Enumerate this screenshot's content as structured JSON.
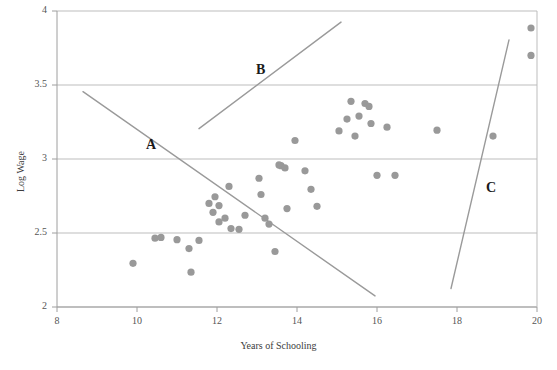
{
  "chart_data": {
    "type": "scatter",
    "title": "",
    "xlabel": "Years of Schooling",
    "ylabel": "Log Wage",
    "xlim": [
      8,
      20
    ],
    "ylim": [
      2,
      4
    ],
    "xticks": [
      8,
      10,
      12,
      14,
      16,
      18,
      20
    ],
    "yticks": [
      2,
      2.5,
      3,
      3.5,
      4
    ],
    "grid": "horizontal",
    "legend": "none",
    "marker_color": "#999999",
    "line_color": "#9a9a9a",
    "points": [
      {
        "x": 9.9,
        "y": 2.295
      },
      {
        "x": 10.45,
        "y": 2.465
      },
      {
        "x": 10.6,
        "y": 2.47
      },
      {
        "x": 11.0,
        "y": 2.455
      },
      {
        "x": 11.3,
        "y": 2.395
      },
      {
        "x": 11.35,
        "y": 2.235
      },
      {
        "x": 11.55,
        "y": 2.45
      },
      {
        "x": 11.8,
        "y": 2.7
      },
      {
        "x": 11.9,
        "y": 2.64
      },
      {
        "x": 11.95,
        "y": 2.745
      },
      {
        "x": 12.05,
        "y": 2.685
      },
      {
        "x": 12.05,
        "y": 2.575
      },
      {
        "x": 12.2,
        "y": 2.6
      },
      {
        "x": 12.3,
        "y": 2.815
      },
      {
        "x": 12.35,
        "y": 2.53
      },
      {
        "x": 12.55,
        "y": 2.525
      },
      {
        "x": 12.7,
        "y": 2.62
      },
      {
        "x": 13.05,
        "y": 2.87
      },
      {
        "x": 13.1,
        "y": 2.76
      },
      {
        "x": 13.2,
        "y": 2.6
      },
      {
        "x": 13.3,
        "y": 2.56
      },
      {
        "x": 13.45,
        "y": 2.375
      },
      {
        "x": 13.55,
        "y": 2.96
      },
      {
        "x": 13.6,
        "y": 2.955
      },
      {
        "x": 13.7,
        "y": 2.94
      },
      {
        "x": 13.75,
        "y": 2.665
      },
      {
        "x": 13.95,
        "y": 3.125
      },
      {
        "x": 14.2,
        "y": 2.92
      },
      {
        "x": 14.35,
        "y": 2.795
      },
      {
        "x": 14.5,
        "y": 2.68
      },
      {
        "x": 15.05,
        "y": 3.19
      },
      {
        "x": 15.25,
        "y": 3.27
      },
      {
        "x": 15.35,
        "y": 3.39
      },
      {
        "x": 15.45,
        "y": 3.155
      },
      {
        "x": 15.55,
        "y": 3.29
      },
      {
        "x": 15.7,
        "y": 3.375
      },
      {
        "x": 15.8,
        "y": 3.355
      },
      {
        "x": 15.85,
        "y": 3.24
      },
      {
        "x": 16.0,
        "y": 2.89
      },
      {
        "x": 16.25,
        "y": 3.215
      },
      {
        "x": 16.45,
        "y": 2.89
      },
      {
        "x": 17.5,
        "y": 3.195
      },
      {
        "x": 18.9,
        "y": 3.155
      },
      {
        "x": 19.85,
        "y": 3.885
      },
      {
        "x": 19.85,
        "y": 3.7
      }
    ],
    "lines": [
      {
        "label": "A",
        "x1": 8.65,
        "y1": 3.455,
        "x2": 15.95,
        "y2": 2.075,
        "label_x": 10.35,
        "label_y": 3.085
      },
      {
        "label": "B",
        "x1": 11.55,
        "y1": 3.205,
        "x2": 15.1,
        "y2": 3.925,
        "label_x": 13.1,
        "label_y": 3.595
      },
      {
        "label": "C",
        "x1": 17.85,
        "y1": 2.125,
        "x2": 19.3,
        "y2": 3.805,
        "label_x": 18.85,
        "label_y": 2.8
      }
    ]
  },
  "caption": {
    "text": ""
  }
}
